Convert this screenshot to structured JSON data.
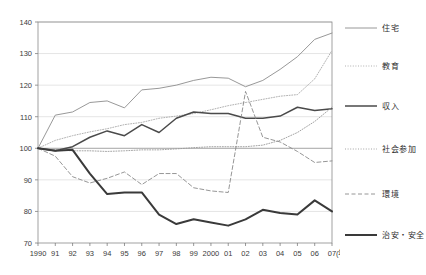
{
  "chart_data": {
    "type": "line",
    "title": "",
    "xlabel": "(年)",
    "ylabel": "",
    "x": [
      "1990",
      "91",
      "92",
      "93",
      "94",
      "95",
      "96",
      "97",
      "98",
      "99",
      "2000",
      "01",
      "02",
      "03",
      "04",
      "05",
      "06",
      "07"
    ],
    "ylim": [
      70,
      140
    ],
    "ytick_values": [
      70,
      80,
      90,
      100,
      110,
      120,
      130,
      140
    ],
    "ytick_labels": [
      "70",
      "80",
      "90",
      "100",
      "110",
      "120",
      "130",
      "140"
    ],
    "grid": true,
    "baseline": 100,
    "legend_position": "right",
    "series": [
      {
        "name": "住宅",
        "style": "solid-thin",
        "color": "#8c8c8c",
        "values": [
          100,
          110.5,
          111.5,
          114.5,
          115,
          112.8,
          118.5,
          119,
          120,
          121.5,
          122.5,
          122.2,
          119.5,
          121.5,
          125,
          129,
          134.5,
          136.5
        ]
      },
      {
        "name": "教育",
        "style": "dotted",
        "color": "#a8a8a8",
        "values": [
          100,
          102.5,
          104,
          105.2,
          106.2,
          107.5,
          108.2,
          109.5,
          110.2,
          111,
          112.2,
          113.5,
          114.5,
          115.5,
          116.5,
          117,
          122,
          131
        ]
      },
      {
        "name": "収入",
        "style": "solid-medium",
        "color": "#4a4a4a",
        "values": [
          100,
          99.2,
          100.5,
          103.5,
          105.5,
          104,
          107.5,
          105,
          109.5,
          111.5,
          111,
          111,
          109.5,
          109.5,
          110.2,
          113,
          112,
          112.5
        ]
      },
      {
        "name": "社会参加",
        "style": "dotted",
        "color": "#9a9a9a",
        "values": [
          100,
          99.5,
          99.2,
          99.2,
          99,
          99.2,
          99.5,
          99.5,
          99.8,
          100.2,
          100.5,
          100.5,
          100.5,
          101,
          102.5,
          105,
          108.5,
          113
        ]
      },
      {
        "name": "環境",
        "style": "dashed",
        "color": "#8a8a8a",
        "values": [
          100,
          97.5,
          91,
          89,
          90.5,
          92.5,
          88.5,
          92,
          92,
          87.5,
          86.5,
          86,
          118,
          103.5,
          102,
          99,
          95.5,
          96
        ]
      },
      {
        "name": "治安・安全",
        "style": "solid-thick",
        "color": "#3a3a3a",
        "values": [
          100,
          99.2,
          99.5,
          92,
          85.5,
          86,
          86,
          79,
          76,
          77.5,
          76.5,
          75.5,
          77.5,
          80.5,
          79.5,
          79,
          83.5,
          80
        ]
      }
    ]
  },
  "legend": {
    "entries": [
      {
        "label": "住宅"
      },
      {
        "label": "教育"
      },
      {
        "label": "収入"
      },
      {
        "label": "社会参加"
      },
      {
        "label": "環境"
      },
      {
        "label": "治安・安全"
      }
    ]
  }
}
